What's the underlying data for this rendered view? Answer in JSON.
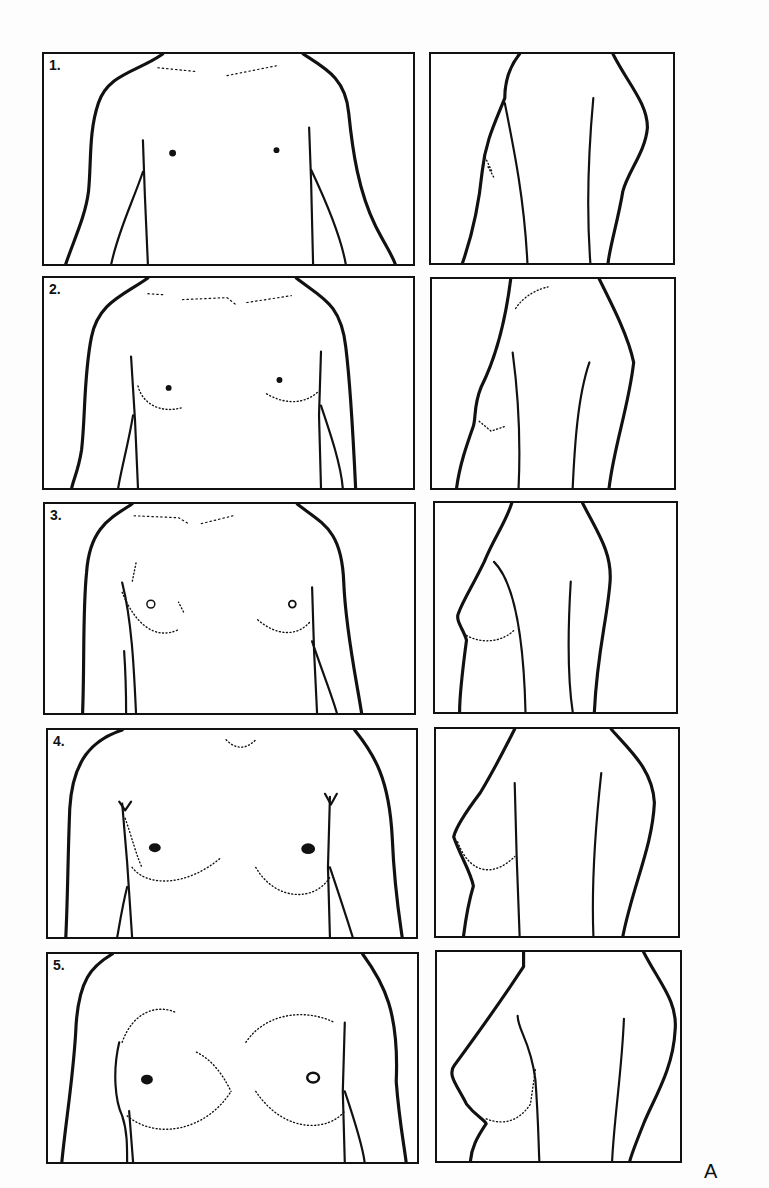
{
  "figure": {
    "label": "A",
    "stages": [
      {
        "number": "1.",
        "frontal": "stage-1-frontal",
        "lateral": "stage-1-lateral"
      },
      {
        "number": "2.",
        "frontal": "stage-2-frontal",
        "lateral": "stage-2-lateral"
      },
      {
        "number": "3.",
        "frontal": "stage-3-frontal",
        "lateral": "stage-3-lateral"
      },
      {
        "number": "4.",
        "frontal": "stage-4-frontal",
        "lateral": "stage-4-lateral"
      },
      {
        "number": "5.",
        "frontal": "stage-5-frontal",
        "lateral": "stage-5-lateral"
      }
    ]
  },
  "colors": {
    "ink": "#111111",
    "paper": "#ffffff"
  }
}
